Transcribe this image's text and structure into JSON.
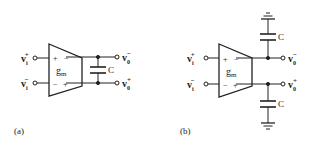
{
  "figure_a": {
    "panel_label": "(a)",
    "amp_label": "g",
    "amp_sub": "m",
    "in_plus": {
      "base": "v",
      "sub": "i",
      "sup": "+"
    },
    "in_minus": {
      "base": "v",
      "sub": "i",
      "sup": "−"
    },
    "out_minus": {
      "base": "v",
      "sub": "0",
      "sup": "−"
    },
    "out_plus": {
      "base": "v",
      "sub": "0",
      "sup": "+"
    },
    "input_signs_top": [
      "+",
      "−"
    ],
    "input_signs_bottom": [
      "−",
      "+"
    ],
    "cap_label": "C"
  },
  "figure_b": {
    "panel_label": "(b)",
    "amp_label": "g",
    "amp_sub": "m",
    "in_plus": {
      "base": "v",
      "sub": "i",
      "sup": "+"
    },
    "in_minus": {
      "base": "v",
      "sub": "i",
      "sup": "−"
    },
    "out_minus": {
      "base": "v",
      "sub": "0",
      "sup": "−"
    },
    "out_plus": {
      "base": "v",
      "sub": "0",
      "sup": "+"
    },
    "input_signs_top": [
      "+",
      "−"
    ],
    "input_signs_bottom": [
      "−",
      "+"
    ],
    "cap_top_label": "C",
    "cap_bottom_label": "C"
  }
}
